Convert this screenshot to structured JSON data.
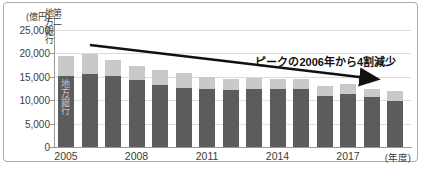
{
  "chart_data": {
    "type": "bar",
    "stacked": true,
    "title": "",
    "unit_label": "(億円)",
    "x_axis_unit": "(年度)",
    "annotation": "ピークの2006年から4割減少",
    "ylim": [
      0,
      25000
    ],
    "grid": true,
    "legend_position": "top-left-vertical",
    "years": [
      "2005",
      "2006",
      "2007",
      "2008",
      "2009",
      "2010",
      "2011",
      "2012",
      "2013",
      "2014",
      "2015",
      "2016",
      "2017",
      "2018",
      "2019"
    ],
    "x_ticks": [
      {
        "label": "2005",
        "index": 0
      },
      {
        "label": "2008",
        "index": 3
      },
      {
        "label": "2011",
        "index": 6
      },
      {
        "label": "2014",
        "index": 9
      },
      {
        "label": "2017",
        "index": 12
      }
    ],
    "y_ticks": [
      {
        "label": "25,000",
        "value": 25000
      },
      {
        "label": "20,000",
        "value": 20000
      },
      {
        "label": "15,000",
        "value": 15000
      },
      {
        "label": "10,000",
        "value": 10000
      },
      {
        "label": "5,000",
        "value": 5000
      },
      {
        "label": "0",
        "value": 0
      }
    ],
    "series": [
      {
        "name": "地方銀行",
        "color": "#5c5c5c",
        "values": [
          15100,
          15600,
          15200,
          14300,
          13200,
          12700,
          12400,
          12200,
          12300,
          12300,
          12300,
          11000,
          11300,
          10600,
          9900
        ]
      },
      {
        "name": "第二地方銀行",
        "color": "#c9c9c9",
        "values": [
          4300,
          4200,
          3400,
          3000,
          3200,
          3100,
          2600,
          2400,
          2400,
          2300,
          2200,
          2000,
          2100,
          1900,
          2000
        ]
      }
    ]
  },
  "legend": {
    "second_regional_col_right": "第二",
    "second_regional_col_left": "地方銀行",
    "bar_label_regional": "地方銀行"
  },
  "colors": {
    "bar_dark": "#5c5c5c",
    "bar_light": "#c9c9c9",
    "arrow": "#111111",
    "axis": "#999999",
    "gridline": "#dcdcdc",
    "text": "#3c3c3c",
    "bar_inner_label": "#c6c6c6",
    "card_border": "#aaaaaa"
  }
}
